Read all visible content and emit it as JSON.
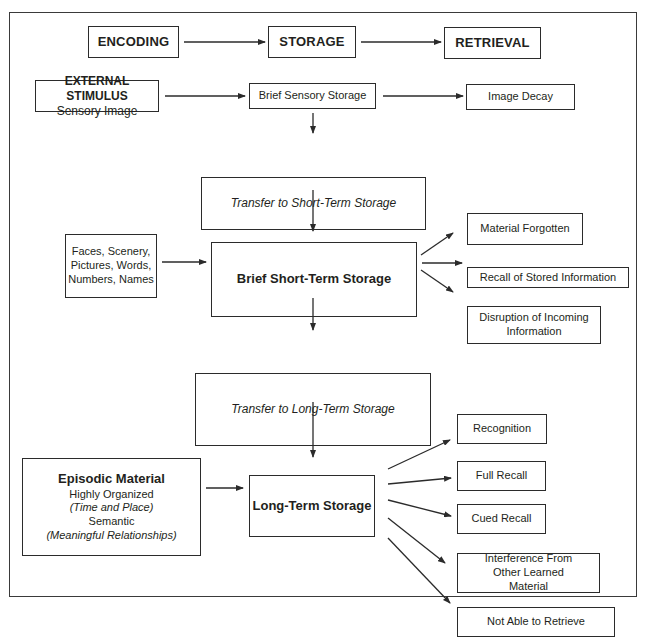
{
  "diagram": {
    "top_row": [
      {
        "id": "encoding",
        "label": "ENCODING"
      },
      {
        "id": "storage",
        "label": "STORAGE"
      },
      {
        "id": "retrieval",
        "label": "RETRIEVAL"
      }
    ],
    "external_stimulus": {
      "title": "EXTERNAL STIMULUS",
      "subtitle": "Sensory Image"
    },
    "brief_sensory_storage": {
      "label": "Brief Sensory Storage"
    },
    "image_decay": {
      "label": "Image Decay"
    },
    "transfer_short_term": {
      "label": "Transfer to Short-Term Storage"
    },
    "inputs": {
      "lines": [
        "Faces, Scenery,",
        "Pictures, Words,",
        "Numbers, Names"
      ]
    },
    "brief_short_term_storage": {
      "label": "Brief Short-Term Storage"
    },
    "short_term_outcomes": [
      {
        "label": "Material Forgotten"
      },
      {
        "label": "Recall of Stored Information"
      },
      {
        "label": "Disruption of Incoming Information"
      }
    ],
    "transfer_long_term": {
      "label": "Transfer to Long-Term Storage"
    },
    "episodic": {
      "title": "Episodic Material",
      "line1": "Highly Organized",
      "line2": "(Time and Place)",
      "line3": "Semantic",
      "line4": "(Meaningful Relationships)"
    },
    "long_term_storage": {
      "label": "Long-Term Storage"
    },
    "long_term_outcomes": [
      {
        "label": "Recognition"
      },
      {
        "label": "Full Recall"
      },
      {
        "label": "Cued Recall"
      },
      {
        "label": "Interference From Other Learned Material"
      },
      {
        "label": "Not Able to Retrieve"
      }
    ]
  },
  "colors": {
    "stroke": "#2b2b2b",
    "text": "#231f20",
    "background": "#ffffff"
  }
}
